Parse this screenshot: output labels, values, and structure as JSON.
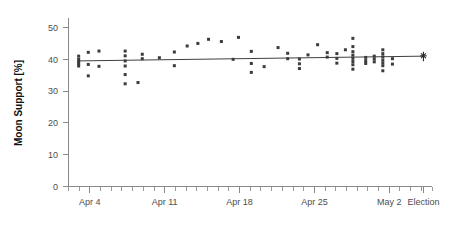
{
  "chart_data": {
    "type": "scatter",
    "title": "",
    "xlabel": "",
    "ylabel": "Moon Support [%]",
    "ylim": [
      0,
      53
    ],
    "yticks": [
      0,
      10,
      20,
      30,
      40,
      50
    ],
    "ytick_labels": [
      "0",
      "10",
      "20",
      "30",
      "40",
      "50"
    ],
    "xlim": [
      0,
      34
    ],
    "xtick_labels": [
      "Apr 4",
      "Apr 11",
      "Apr 18",
      "Apr 25",
      "May 2",
      "Election"
    ],
    "xtick_positions": [
      2,
      9,
      16,
      23,
      30,
      33.2
    ],
    "x_minor_tick_step": 1,
    "grid": false,
    "legend": false,
    "series": [
      {
        "name": "Moon Support polls",
        "marker": "square",
        "color": "#3c3c3c",
        "points": [
          {
            "x": 0.95,
            "y": 41.0
          },
          {
            "x": 0.95,
            "y": 40.0
          },
          {
            "x": 0.95,
            "y": 39.3
          },
          {
            "x": 0.95,
            "y": 38.6
          },
          {
            "x": 0.95,
            "y": 37.9
          },
          {
            "x": 1.85,
            "y": 42.2
          },
          {
            "x": 1.85,
            "y": 38.4
          },
          {
            "x": 1.85,
            "y": 34.8
          },
          {
            "x": 2.85,
            "y": 42.6
          },
          {
            "x": 2.85,
            "y": 37.8
          },
          {
            "x": 5.3,
            "y": 42.6
          },
          {
            "x": 5.3,
            "y": 41.1
          },
          {
            "x": 5.3,
            "y": 39.5
          },
          {
            "x": 5.3,
            "y": 37.9
          },
          {
            "x": 5.3,
            "y": 35.2
          },
          {
            "x": 5.3,
            "y": 32.3
          },
          {
            "x": 6.5,
            "y": 32.7
          },
          {
            "x": 6.9,
            "y": 41.6
          },
          {
            "x": 6.9,
            "y": 40.2
          },
          {
            "x": 8.5,
            "y": 40.5
          },
          {
            "x": 9.9,
            "y": 42.3
          },
          {
            "x": 9.9,
            "y": 38.0
          },
          {
            "x": 11.1,
            "y": 44.2
          },
          {
            "x": 12.1,
            "y": 45.0
          },
          {
            "x": 13.1,
            "y": 46.3
          },
          {
            "x": 14.3,
            "y": 45.6
          },
          {
            "x": 15.4,
            "y": 40.0
          },
          {
            "x": 15.9,
            "y": 46.9
          },
          {
            "x": 17.1,
            "y": 42.5
          },
          {
            "x": 17.1,
            "y": 38.7
          },
          {
            "x": 17.1,
            "y": 35.9
          },
          {
            "x": 18.3,
            "y": 37.7
          },
          {
            "x": 19.6,
            "y": 43.7
          },
          {
            "x": 20.5,
            "y": 41.9
          },
          {
            "x": 20.5,
            "y": 40.2
          },
          {
            "x": 21.6,
            "y": 40.1
          },
          {
            "x": 21.6,
            "y": 38.6
          },
          {
            "x": 21.6,
            "y": 37.1
          },
          {
            "x": 22.4,
            "y": 41.4
          },
          {
            "x": 23.3,
            "y": 44.6
          },
          {
            "x": 24.2,
            "y": 42.1
          },
          {
            "x": 24.2,
            "y": 40.7
          },
          {
            "x": 25.1,
            "y": 41.8
          },
          {
            "x": 25.1,
            "y": 40.3
          },
          {
            "x": 25.1,
            "y": 38.8
          },
          {
            "x": 25.9,
            "y": 43.0
          },
          {
            "x": 26.6,
            "y": 46.6
          },
          {
            "x": 26.6,
            "y": 44.0
          },
          {
            "x": 26.6,
            "y": 42.4
          },
          {
            "x": 26.6,
            "y": 41.3
          },
          {
            "x": 26.6,
            "y": 40.3
          },
          {
            "x": 26.6,
            "y": 39.3
          },
          {
            "x": 26.6,
            "y": 38.3
          },
          {
            "x": 26.6,
            "y": 36.9
          },
          {
            "x": 27.8,
            "y": 40.6
          },
          {
            "x": 27.8,
            "y": 39.6
          },
          {
            "x": 27.8,
            "y": 38.7
          },
          {
            "x": 28.6,
            "y": 41.0
          },
          {
            "x": 28.6,
            "y": 40.1
          },
          {
            "x": 28.6,
            "y": 39.2
          },
          {
            "x": 29.4,
            "y": 43.0
          },
          {
            "x": 29.4,
            "y": 41.8
          },
          {
            "x": 29.4,
            "y": 40.8
          },
          {
            "x": 29.4,
            "y": 39.8
          },
          {
            "x": 29.4,
            "y": 38.9
          },
          {
            "x": 29.4,
            "y": 38.0
          },
          {
            "x": 29.4,
            "y": 36.4
          },
          {
            "x": 30.3,
            "y": 40.2
          },
          {
            "x": 30.3,
            "y": 38.5
          }
        ]
      }
    ],
    "trend_line": {
      "name": "fitted trend",
      "color": "#3f3f3f",
      "start": {
        "x": 0.95,
        "y": 39.5
      },
      "end": {
        "x": 33.2,
        "y": 41.0
      }
    },
    "election_marker": {
      "name": "Election result",
      "x": 33.2,
      "y": 41.1,
      "style": "asterisk-with-error-bar",
      "low": 39.4,
      "high": 42.4
    },
    "annotations": []
  }
}
